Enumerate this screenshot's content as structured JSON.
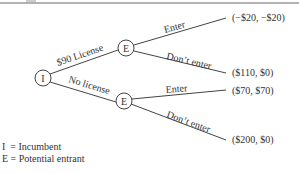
{
  "diagram": {
    "type": "game-tree",
    "root": {
      "label": "I",
      "branches": [
        {
          "label": "$90 License",
          "node": {
            "label": "E",
            "branches": [
              {
                "label": "Enter",
                "payoff": "(−$20, −$20)"
              },
              {
                "label": "Don’t enter",
                "payoff": "($110, $0)"
              }
            ]
          }
        },
        {
          "label": "No license",
          "node": {
            "label": "E",
            "branches": [
              {
                "label": "Enter",
                "payoff": "($70, $70)"
              },
              {
                "label": "Don’t enter",
                "payoff": "($200, $0)"
              }
            ]
          }
        }
      ]
    },
    "legend": [
      "I  = Incumbent",
      "E = Potential entrant"
    ]
  }
}
